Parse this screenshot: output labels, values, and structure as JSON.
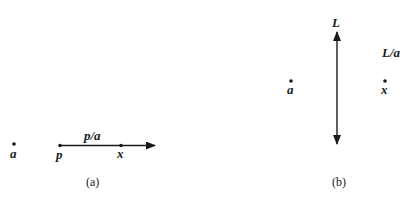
{
  "panel_a": {
    "caption": "(a)",
    "point_a_label": "a",
    "point_p_label": "p",
    "point_x_label": "x",
    "arrow_label": "p/a"
  },
  "panel_b": {
    "caption": "(b)",
    "point_a_label": "a",
    "point_x_label": "x",
    "line_label": "L",
    "reflection_label": "L/a"
  },
  "colors": {
    "ink": "#1a1a1a",
    "background": "#ffffff"
  }
}
